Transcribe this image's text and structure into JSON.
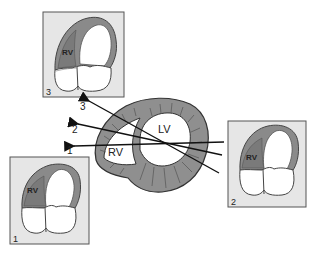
{
  "diagram": {
    "type": "echocardiography imaging planes",
    "cross_section": {
      "lv_label": "LV",
      "rv_label": "RV"
    },
    "planes": [
      {
        "number": "1",
        "label": "1"
      },
      {
        "number": "2",
        "label": "2"
      },
      {
        "number": "3",
        "label": "3"
      }
    ],
    "views": [
      {
        "number": "3",
        "corner_label": "3",
        "rv_label": "RV"
      },
      {
        "number": "2",
        "corner_label": "2",
        "rv_label": "RV"
      },
      {
        "number": "1",
        "corner_label": "1",
        "rv_label": "RV"
      }
    ],
    "colors": {
      "myocardium": "#8f8f8f",
      "panel_bg": "#e6e6e6",
      "outline": "#444444",
      "rv_fill": "#8a8a8a"
    }
  }
}
